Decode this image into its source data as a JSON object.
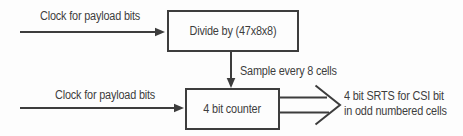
{
  "diagram": {
    "colors": {
      "ink": "#3d3d3d",
      "background": "#fdfdfd"
    },
    "labels": {
      "clock_top": "Clock for payload bits",
      "clock_bottom": "Clock for payload bits",
      "sample": "Sample every 8 cells",
      "output_line1": "4 bit SRTS for CSI bit",
      "output_line2": "in odd numbered cells"
    },
    "nodes": {
      "divider": "Divide by (47x8x8)",
      "counter": "4 bit counter"
    }
  }
}
